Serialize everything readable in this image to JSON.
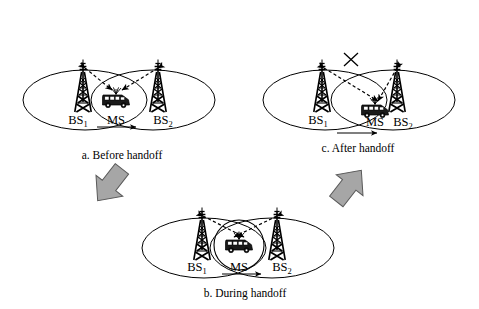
{
  "figure": {
    "background_color": "#ffffff",
    "line_color": "#000000",
    "arrow_fill_color": "#a6a6a6",
    "arrow_stroke_color": "#595959"
  },
  "panels": [
    {
      "id": "panel-a",
      "caption": "a. Before handoff",
      "labels": {
        "bs1_prefix": "BS",
        "bs1_sub": "1",
        "bs2_prefix": "BS",
        "bs2_sub": "2",
        "ms": "MS"
      },
      "icons": {
        "tower_left": "cell-tower-icon",
        "tower_right": "cell-tower-icon",
        "mobile_station": "mobile-van-icon",
        "motion": "motion-arrow-icon"
      },
      "links": [
        {
          "name": "link-ms-to-bs1",
          "state": "active",
          "style": "dashed-bidirectional"
        },
        {
          "name": "link-ms-to-bs2",
          "state": "active",
          "style": "dashed-bidirectional"
        }
      ],
      "overlap_circle": false
    },
    {
      "id": "panel-b",
      "caption": "b. During handoff",
      "labels": {
        "bs1_prefix": "BS",
        "bs1_sub": "1",
        "bs2_prefix": "BS",
        "bs2_sub": "2",
        "ms": "MS"
      },
      "icons": {
        "tower_left": "cell-tower-icon",
        "tower_right": "cell-tower-icon",
        "mobile_station": "mobile-van-icon",
        "motion": "motion-arrow-icon"
      },
      "links": [
        {
          "name": "link-ms-to-bs1",
          "state": "active",
          "style": "dashed-bidirectional"
        },
        {
          "name": "link-ms-to-bs2",
          "state": "active",
          "style": "dashed-bidirectional"
        }
      ],
      "overlap_circle": true
    },
    {
      "id": "panel-c",
      "caption": "c. After handoff",
      "labels": {
        "bs1_prefix": "BS",
        "bs1_sub": "1",
        "bs2_prefix": "BS",
        "bs2_sub": "2",
        "ms": "MS"
      },
      "icons": {
        "tower_left": "cell-tower-icon",
        "tower_right": "cell-tower-icon",
        "mobile_station": "mobile-van-icon",
        "motion": "motion-arrow-icon",
        "broken_link": "x-cross-icon"
      },
      "links": [
        {
          "name": "link-ms-to-bs1",
          "state": "broken",
          "style": "dashed-bidirectional-crossed"
        },
        {
          "name": "link-ms-to-bs2",
          "state": "active",
          "style": "dashed-bidirectional"
        }
      ],
      "overlap_circle": false
    }
  ],
  "flow_arrows": [
    {
      "name": "flow-arrow-a-to-b",
      "direction": "down-right",
      "from": "panel-a",
      "to": "panel-b"
    },
    {
      "name": "flow-arrow-b-to-c",
      "direction": "up-right",
      "from": "panel-b",
      "to": "panel-c"
    }
  ]
}
